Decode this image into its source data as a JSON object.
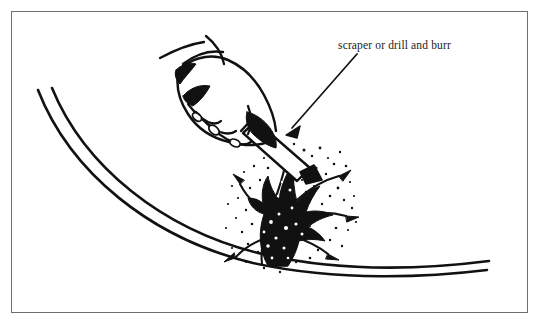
{
  "figure": {
    "kind": "technical-line-illustration",
    "background_color": "#ffffff",
    "ink_color": "#111111",
    "border": {
      "present": true,
      "color": "#6f6f6f",
      "inset_px": 11,
      "stroke_px": 1
    },
    "annotation": {
      "label": "scraper or drill and burr",
      "text_x": 338,
      "text_y": 49,
      "font_size_px": 11.5,
      "leader_line": {
        "from_x": 357,
        "from_y": 54,
        "to_x": 287,
        "to_y": 134,
        "stroke_px": 1.6,
        "arrowhead": "solid-triangle",
        "arrow_points_to": "tool tip against fouled hull"
      }
    },
    "hull": {
      "description": "Two parallel curved lines of the hull bottom sweeping from upper-left down to lower-right",
      "line_count": 2,
      "stroke_px": 2.6,
      "outer_path": "M 38,90 C 70,172 150,238 253,263 C 340,282 430,277 487,270",
      "inner_path": "M 52,88 C 84,166 162,230 262,254 C 348,274 434,268 489,261"
    },
    "tool": {
      "name": "scraper or drill and burr",
      "description": "Light shaft with dark outline held at an angle, tip buried in marine growth",
      "angle_deg": 38
    },
    "hand": {
      "description": "Line-art hand with curled fingers gripping the tool, cuff open at the wrist",
      "shading": "solid black shadow masses between fingers and under the palm"
    },
    "growth": {
      "description": "Branching coral and barnacle fouling attached to the hull, with stippled debris spraying from the scrape point",
      "branch_count": 5,
      "stipple_dots": 120
    }
  }
}
